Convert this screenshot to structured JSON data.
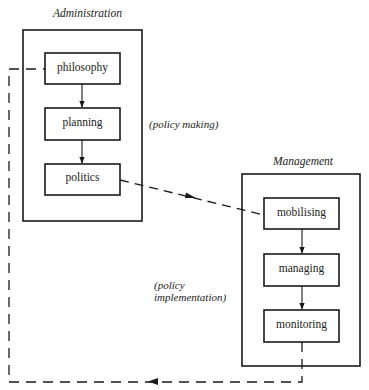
{
  "groups": {
    "administration": {
      "title": "Administration",
      "nodes": [
        "philosophy",
        "planning",
        "politics"
      ]
    },
    "management": {
      "title": "Management",
      "nodes": [
        "mobilising",
        "managing",
        "monitoring"
      ]
    }
  },
  "annotations": {
    "policy_making": "(policy making)",
    "policy_implementation_line1": "(policy",
    "policy_implementation_line2": "implementation)"
  },
  "edges": [
    {
      "from": "philosophy",
      "to": "planning",
      "style": "solid"
    },
    {
      "from": "planning",
      "to": "politics",
      "style": "solid"
    },
    {
      "from": "politics",
      "to": "mobilising",
      "style": "dashed"
    },
    {
      "from": "mobilising",
      "to": "managing",
      "style": "solid"
    },
    {
      "from": "managing",
      "to": "monitoring",
      "style": "solid"
    },
    {
      "from": "monitoring",
      "to": "philosophy",
      "style": "dashed",
      "note": "feedback loop"
    }
  ],
  "colors": {
    "stroke": "#1a1a1a",
    "background": "#ffffff"
  }
}
